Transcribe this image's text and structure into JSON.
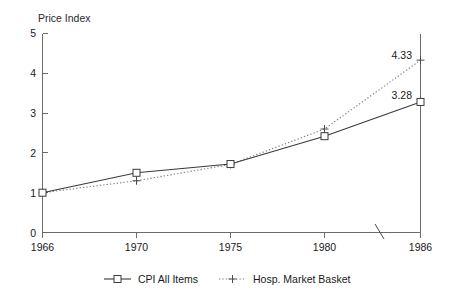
{
  "chart_data": {
    "type": "line",
    "title": "",
    "subtitle": "",
    "xlabel": "",
    "ylabel": "Price Index",
    "x": [
      1966,
      1970,
      1975,
      1980,
      1986
    ],
    "xtick_labels": [
      "1966",
      "1970",
      "1975",
      "1980",
      "1986"
    ],
    "ytick_labels": [
      "0",
      "1",
      "2",
      "3",
      "4",
      "5"
    ],
    "ylim": [
      0,
      5
    ],
    "yticks": [
      0,
      1,
      2,
      3,
      4,
      5
    ],
    "grid": false,
    "legend_position": "bottom",
    "axis_break": true,
    "series": [
      {
        "name": "CPI All Items",
        "marker": "square",
        "line_style": "solid",
        "values": [
          1.0,
          1.5,
          1.72,
          2.42,
          3.28
        ],
        "end_label": "3.28"
      },
      {
        "name": "Hosp. Market Basket",
        "marker": "plus",
        "line_style": "dotted",
        "values": [
          1.0,
          1.3,
          1.71,
          2.6,
          4.33
        ],
        "end_label": "4.33"
      }
    ],
    "annotations": [
      {
        "text": "4.33",
        "series": "Hosp. Market Basket",
        "x": 1986,
        "y": 4.33
      },
      {
        "text": "3.28",
        "series": "CPI All Items",
        "x": 1986,
        "y": 3.28
      }
    ]
  },
  "axis": {
    "y_label": "Price Index",
    "y_ticks": [
      "5",
      "4",
      "3",
      "2",
      "1",
      "0"
    ],
    "x_ticks": [
      "1966",
      "1970",
      "1975",
      "1980",
      "1986"
    ]
  },
  "legend": {
    "entries": [
      {
        "label": "CPI All Items",
        "marker_icon": "square-marker-icon"
      },
      {
        "label": "Hosp. Market Basket",
        "marker_icon": "plus-marker-icon"
      }
    ]
  },
  "labels": {
    "end_label_hosp": "4.33",
    "end_label_cpi": "3.28"
  }
}
